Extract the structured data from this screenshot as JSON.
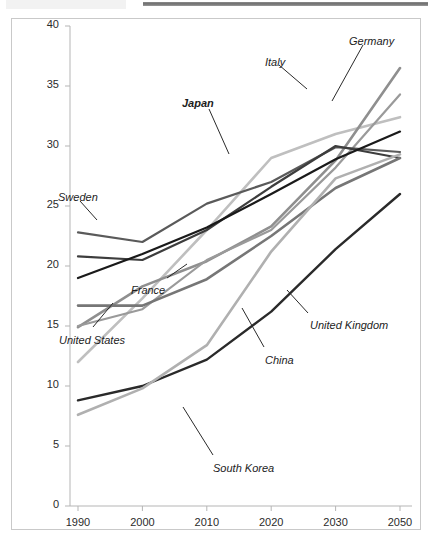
{
  "artifacts": {
    "top_bar_name": "window-title-bar-strip",
    "top_ghost_name": "clipped-header-text"
  },
  "chart_data": {
    "type": "line",
    "title": "",
    "subtitle": "",
    "xlabel": "",
    "ylabel": "",
    "grid": false,
    "legend": "inline-annotations",
    "categories": [
      "1990",
      "2000",
      "2010",
      "2020",
      "2030",
      "2050"
    ],
    "x_tick_labels": [
      "1990",
      "2000",
      "2010",
      "2020",
      "2030",
      "2050"
    ],
    "y_tick_labels": [
      "0",
      "5",
      "10",
      "15",
      "20",
      "25",
      "30",
      "35",
      "40"
    ],
    "ylim": [
      0,
      40
    ],
    "y_tick_step": 5,
    "series": [
      {
        "name": "Japan",
        "color": "#bfbfbf",
        "width": 2.6,
        "values": [
          12.0,
          17.3,
          23.0,
          29.0,
          31.0,
          32.4
        ]
      },
      {
        "name": "Italy",
        "color": "#8f8f8f",
        "width": 2.6,
        "values": [
          14.9,
          18.3,
          20.4,
          23.3,
          28.8,
          36.5
        ]
      },
      {
        "name": "Germany",
        "color": "#9a9a9a",
        "width": 2.2,
        "values": [
          15.0,
          16.4,
          20.5,
          23.0,
          28.2,
          34.3
        ]
      },
      {
        "name": "Sweden",
        "color": "#5a5a5a",
        "width": 2.2,
        "values": [
          22.8,
          22.0,
          25.2,
          27.0,
          29.9,
          29.5
        ]
      },
      {
        "name": "France",
        "color": "#3d3d3d",
        "width": 2.2,
        "values": [
          20.8,
          20.5,
          23.0,
          26.6,
          30.0,
          29.0
        ]
      },
      {
        "name": "United Kingdom",
        "color": "#1a1a1a",
        "width": 2.2,
        "values": [
          19.0,
          21.0,
          23.2,
          26.0,
          28.9,
          31.2
        ]
      },
      {
        "name": "United States",
        "color": "#767676",
        "width": 2.6,
        "values": [
          16.7,
          16.7,
          18.9,
          22.5,
          26.5,
          29.0
        ]
      },
      {
        "name": "China",
        "color": "#2a2a2a",
        "width": 2.4,
        "values": [
          8.8,
          10.0,
          12.2,
          16.2,
          21.4,
          26.0
        ]
      },
      {
        "name": "South Korea",
        "color": "#b0b0b0",
        "width": 2.6,
        "values": [
          7.6,
          9.8,
          13.4,
          21.2,
          27.3,
          29.3
        ]
      }
    ],
    "annotations": [
      {
        "label": "Japan",
        "bold": true,
        "x": 181,
        "y": 96,
        "leader": [
          208,
          108,
          228,
          153
        ]
      },
      {
        "label": "Italy",
        "bold": false,
        "x": 264,
        "y": 55,
        "leader": [
          278,
          64,
          306,
          88
        ]
      },
      {
        "label": "Germany",
        "bold": false,
        "x": 348,
        "y": 34,
        "leader": [
          362,
          44,
          331,
          100
        ]
      },
      {
        "label": "Sweden",
        "bold": false,
        "x": 57,
        "y": 190,
        "leader": [
          79,
          200,
          96,
          219
        ]
      },
      {
        "label": "France",
        "bold": false,
        "x": 130,
        "y": 283,
        "leader": [
          166,
          277,
          186,
          263
        ]
      },
      {
        "label": "United States",
        "bold": false,
        "x": 58,
        "y": 333,
        "leader": [
          92,
          326,
          112,
          302
        ]
      },
      {
        "label": "United Kingdom",
        "bold": false,
        "x": 309,
        "y": 318,
        "leader": [
          307,
          312,
          286,
          289
        ]
      },
      {
        "label": "China",
        "bold": false,
        "x": 264,
        "y": 353,
        "leader": [
          263,
          346,
          241,
          307
        ]
      },
      {
        "label": "South Korea",
        "bold": false,
        "x": 212,
        "y": 461,
        "leader": [
          212,
          454,
          182,
          406
        ]
      }
    ]
  }
}
